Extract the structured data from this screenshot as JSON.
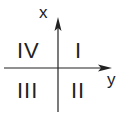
{
  "diagram": {
    "axes": {
      "vertical": {
        "label": "x",
        "direction": "up"
      },
      "horizontal": {
        "label": "y",
        "direction": "right"
      }
    },
    "quadrants": [
      {
        "id": "top-right",
        "label": "I"
      },
      {
        "id": "bottom-right",
        "label": "II"
      },
      {
        "id": "bottom-left",
        "label": "III"
      },
      {
        "id": "top-left",
        "label": "IV"
      }
    ],
    "colors": {
      "line": "#222222",
      "text": "#222222",
      "background": "#ffffff"
    }
  }
}
